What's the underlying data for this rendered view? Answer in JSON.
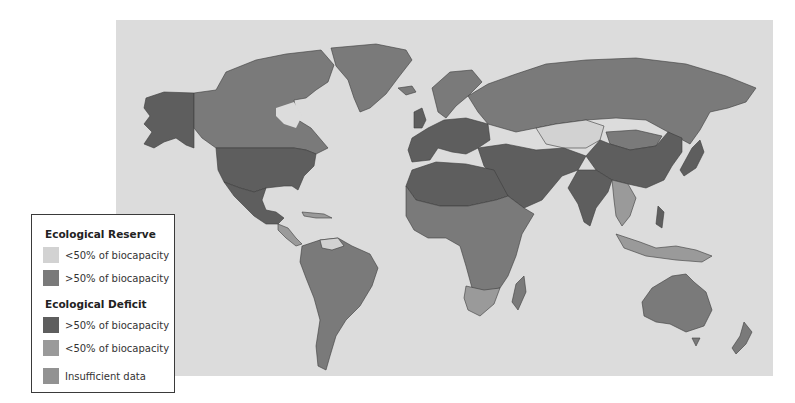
{
  "legend": {
    "reserve_heading": "Ecological Reserve",
    "deficit_heading": "Ecological Deficit",
    "items": [
      {
        "label": "<50% of biocapacity",
        "group": "reserve",
        "color": "#d2d2d2"
      },
      {
        "label": ">50% of biocapacity",
        "group": "reserve",
        "color": "#7a7a7a"
      },
      {
        "label": ">50% of biocapacity",
        "group": "deficit",
        "color": "#5e5e5e"
      },
      {
        "label": "<50% of biocapacity",
        "group": "deficit",
        "color": "#9a9a9a"
      },
      {
        "label": "Insufficient data",
        "group": "none",
        "color": "#929292"
      }
    ]
  },
  "map": {
    "ocean_color": "#dcdcdc",
    "border_color": "#3c3c3c",
    "regions": [
      {
        "name": "alaska",
        "category": "deficit_gt50"
      },
      {
        "name": "canada",
        "category": "reserve_gt50"
      },
      {
        "name": "greenland",
        "category": "reserve_gt50"
      },
      {
        "name": "usa",
        "category": "deficit_gt50"
      },
      {
        "name": "mexico",
        "category": "deficit_gt50"
      },
      {
        "name": "central-america",
        "category": "deficit_lt50"
      },
      {
        "name": "south-america",
        "category": "reserve_gt50"
      },
      {
        "name": "venezuela",
        "category": "reserve_lt50"
      },
      {
        "name": "europe-west",
        "category": "deficit_gt50"
      },
      {
        "name": "scandinavia",
        "category": "reserve_gt50"
      },
      {
        "name": "russia",
        "category": "reserve_gt50"
      },
      {
        "name": "kazakhstan",
        "category": "reserve_lt50"
      },
      {
        "name": "north-africa",
        "category": "deficit_gt50"
      },
      {
        "name": "middle-east",
        "category": "deficit_gt50"
      },
      {
        "name": "central-africa",
        "category": "reserve_gt50"
      },
      {
        "name": "southern-africa",
        "category": "deficit_lt50"
      },
      {
        "name": "madagascar",
        "category": "reserve_gt50"
      },
      {
        "name": "india",
        "category": "deficit_gt50"
      },
      {
        "name": "china",
        "category": "deficit_gt50"
      },
      {
        "name": "mongolia",
        "category": "reserve_gt50"
      },
      {
        "name": "japan",
        "category": "deficit_gt50"
      },
      {
        "name": "southeast-asia",
        "category": "deficit_lt50"
      },
      {
        "name": "indonesia",
        "category": "deficit_lt50"
      },
      {
        "name": "australia",
        "category": "reserve_gt50"
      },
      {
        "name": "new-zealand",
        "category": "reserve_gt50"
      }
    ]
  }
}
